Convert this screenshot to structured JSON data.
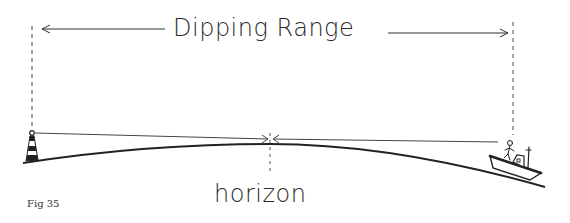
{
  "diagram": {
    "title": "Dipping Range",
    "horizon_label": "horizon",
    "figure_label": "Fig 35",
    "elements": [
      {
        "name": "lighthouse",
        "position": "left"
      },
      {
        "name": "boat-with-observer",
        "position": "right"
      },
      {
        "name": "line-of-sight",
        "description": "straight line from lighthouse light to observer, touching horizon"
      },
      {
        "name": "earth-curve",
        "description": "curved sea surface"
      },
      {
        "name": "range-arrow",
        "description": "double-headed arrow spanning dipping range"
      }
    ],
    "colors": {
      "ink": "#2a2a2a",
      "background": "#ffffff"
    }
  }
}
